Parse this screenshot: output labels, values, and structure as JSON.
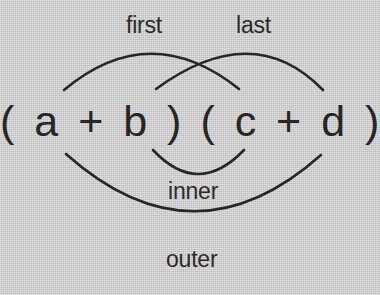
{
  "diagram": {
    "name": "FOIL method diagram",
    "type": "annotated-arc-diagram",
    "background_color": "#cacaca",
    "stroke_color": "#262626",
    "text_color": "#2b2b2b"
  },
  "expression": {
    "left_binomial": "( a + b )",
    "right_binomial": "( c + d )",
    "full": "( a + b )  ( c + d )"
  },
  "labels": {
    "first": "first",
    "last": "last",
    "inner": "inner",
    "outer": "outer"
  },
  "arcs": [
    {
      "label_key": "first",
      "name": "first-arc",
      "description": "arc from above 'a' to above 'c', connecting the first terms of each binomial",
      "start": [
        64,
        90
      ],
      "control": [
        150,
        18
      ],
      "end": [
        239,
        89
      ]
    },
    {
      "label_key": "last",
      "name": "last-arc",
      "description": "arc from above 'b' to above 'd', connecting the last terms of each binomial",
      "start": [
        156,
        89
      ],
      "control": [
        253,
        18
      ],
      "end": [
        323,
        90
      ]
    },
    {
      "label_key": "inner",
      "name": "inner-arc",
      "description": "arc below from 'b' to 'c', connecting the inner terms",
      "start": [
        153,
        150
      ],
      "control": [
        198,
        198
      ],
      "end": [
        244,
        150
      ]
    },
    {
      "label_key": "outer",
      "name": "outer-arc",
      "description": "wide arc below from 'a' to 'd', connecting the outer terms",
      "start": [
        66,
        154
      ],
      "control": [
        194,
        268
      ],
      "end": [
        321,
        155
      ]
    }
  ]
}
